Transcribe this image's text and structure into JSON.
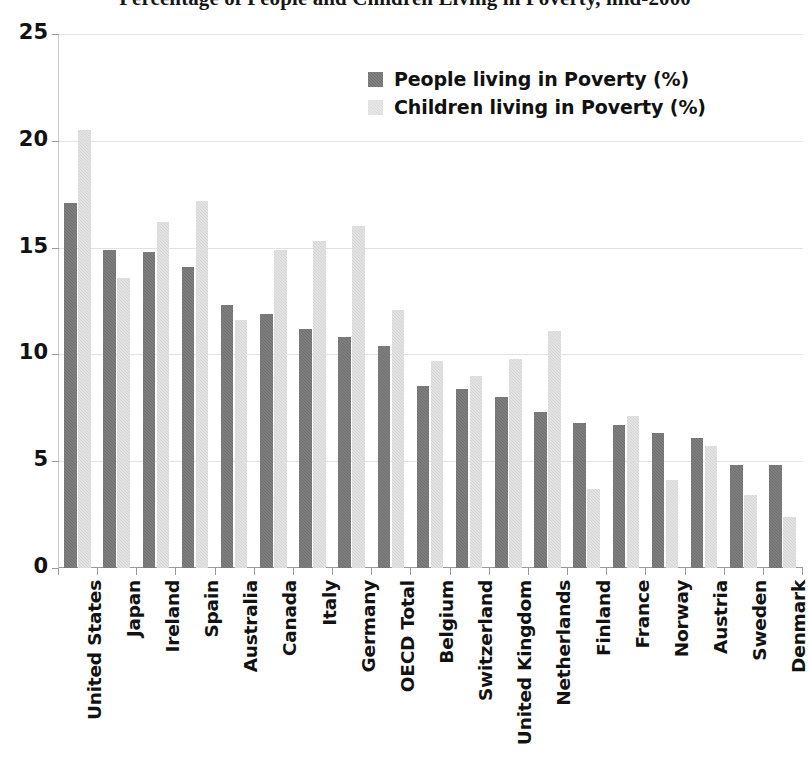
{
  "chart_data": {
    "type": "bar",
    "title": "Percentage of People and Children Living in Poverty, mid-2000",
    "subtitle": "",
    "xlabel": "",
    "ylabel": "",
    "ylim": [
      0,
      25
    ],
    "yticks": [
      0,
      5,
      10,
      15,
      20,
      25
    ],
    "ytick_labels": [
      "0",
      "5",
      "10",
      "15",
      "20",
      "25"
    ],
    "grid": true,
    "legend_position": "top-center",
    "categories": [
      "United States",
      "Japan",
      "Ireland",
      "Spain",
      "Australia",
      "Canada",
      "Italy",
      "Germany",
      "OECD Total",
      "Belgium",
      "Switzerland",
      "United Kingdom",
      "Netherlands",
      "Finland",
      "France",
      "Norway",
      "Austria",
      "Sweden",
      "Denmark"
    ],
    "series": [
      {
        "name": "People living in Poverty (%)",
        "color": "#6f6f6f",
        "values": [
          17.1,
          14.9,
          14.8,
          14.1,
          12.3,
          11.9,
          11.2,
          10.8,
          10.4,
          8.5,
          8.4,
          8.0,
          7.3,
          6.8,
          6.7,
          6.3,
          6.1,
          4.8,
          4.8
        ]
      },
      {
        "name": "Children living in Poverty (%)",
        "color": "#d4d4d4",
        "values": [
          20.5,
          13.6,
          16.2,
          17.2,
          11.6,
          14.9,
          15.3,
          16.0,
          12.1,
          9.7,
          9.0,
          9.8,
          11.1,
          3.7,
          7.1,
          4.1,
          5.7,
          3.4,
          2.4
        ]
      }
    ]
  },
  "legend": {
    "entries": [
      {
        "label": "People living in Poverty (%)",
        "key": "people"
      },
      {
        "label": "Children living in Poverty (%)",
        "key": "children"
      }
    ]
  },
  "axis": {
    "y_max_label": "25",
    "y_min_label": "0"
  }
}
